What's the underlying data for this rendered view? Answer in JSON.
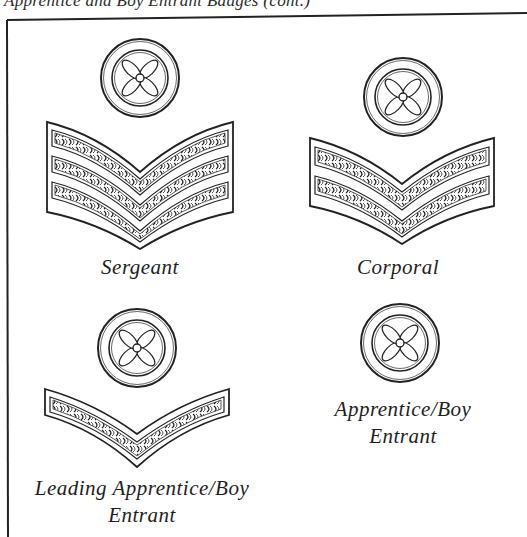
{
  "page": {
    "header_text": "Apprentice and Boy Entrant Badges (cont.)"
  },
  "badges": [
    {
      "rank": "sergeant",
      "caption_lines": [
        "Sergeant"
      ],
      "chevron_count": 3,
      "icon": "propeller-roundel-icon"
    },
    {
      "rank": "corporal",
      "caption_lines": [
        "Corporal"
      ],
      "chevron_count": 2,
      "icon": "propeller-roundel-icon"
    },
    {
      "rank": "leading-apprentice-boy-entrant",
      "caption_lines": [
        "Leading Apprentice/Boy",
        "Entrant"
      ],
      "chevron_count": 1,
      "icon": "propeller-roundel-icon"
    },
    {
      "rank": "apprentice-boy-entrant",
      "caption_lines": [
        "Apprentice/Boy",
        "Entrant"
      ],
      "chevron_count": 0,
      "icon": "propeller-roundel-icon"
    }
  ],
  "colors": {
    "ink": "#1e1e1e",
    "paper": "#ffffff"
  }
}
